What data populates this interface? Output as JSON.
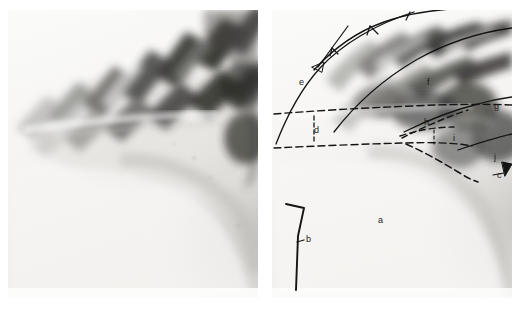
{
  "figure": {
    "type": "radiograph-pair",
    "background_color": "#ffffff",
    "panels": [
      {
        "id": "left",
        "name": "unannotated-radiograph",
        "description": "Lateral thoracic radiograph without annotation overlay",
        "film_base_color": "#f2f1ee",
        "bone_color": "#2b2b2b"
      },
      {
        "id": "right",
        "name": "annotated-radiograph",
        "description": "Same lateral thoracic radiograph with line-drawing annotation overlay and letter labels",
        "film_base_color": "#f2f1ee",
        "bone_color": "#2b2b2b",
        "annotation_line_color": "#141414",
        "annotation_dash_color": "#141414"
      }
    ]
  },
  "annotations": {
    "line_color": "#141414",
    "labels": [
      {
        "key": "a",
        "text": "a",
        "x": 106,
        "y": 211,
        "panel": "right"
      },
      {
        "key": "b",
        "text": "b",
        "x": 33,
        "y": 229,
        "panel": "right"
      },
      {
        "key": "c",
        "text": "c",
        "x": 225,
        "y": 165,
        "panel": "right"
      },
      {
        "key": "d",
        "text": "d",
        "x": 42,
        "y": 120,
        "panel": "right"
      },
      {
        "key": "e",
        "text": "e",
        "x": 27,
        "y": 72,
        "panel": "right"
      },
      {
        "key": "f",
        "text": "f",
        "x": 155,
        "y": 72,
        "panel": "right"
      },
      {
        "key": "g",
        "text": "g",
        "x": 222,
        "y": 96,
        "panel": "right"
      },
      {
        "key": "h",
        "text": "h",
        "x": 153,
        "y": 112,
        "panel": "right"
      },
      {
        "key": "i",
        "text": "i",
        "x": 182,
        "y": 128,
        "panel": "right"
      },
      {
        "key": "j",
        "text": "j",
        "x": 222,
        "y": 147,
        "panel": "right"
      }
    ],
    "markers": [
      {
        "name": "arrowhead-near-e",
        "x": 45,
        "y": 57
      },
      {
        "name": "tick-on-upper-rib-1",
        "x": 57,
        "y": 45
      },
      {
        "name": "tick-on-upper-rib-2",
        "x": 95,
        "y": 24
      },
      {
        "name": "tick-on-upper-rib-3",
        "x": 135,
        "y": 10
      },
      {
        "name": "triangle-marker-at-c",
        "x": 236,
        "y": 161
      },
      {
        "name": "hook-pointer-at-b",
        "x": 25,
        "y": 190
      }
    ]
  }
}
